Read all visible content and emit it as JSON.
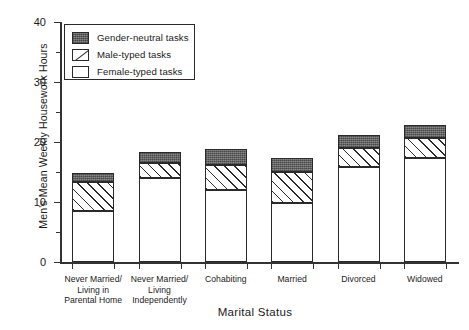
{
  "chart_data": {
    "type": "bar",
    "subtype": "stacked-bar",
    "title": "",
    "xlabel": "Marital Status",
    "ylabel": "Men's Mean Weekly Housework Hours",
    "ylim": [
      0,
      40
    ],
    "ytick_labels": [
      "0",
      "10",
      "20",
      "30",
      "40"
    ],
    "ytick_values": [
      0,
      10,
      20,
      30,
      40
    ],
    "yminor_values": [
      5,
      15,
      25,
      35
    ],
    "grid": false,
    "legend_position": "upper-left-inside",
    "categories": [
      "Never Married/\nLiving in\nParental Home",
      "Never Married/\nLiving\nIndependently",
      "Cohabiting",
      "Married",
      "Divorced",
      "Widowed"
    ],
    "category_lines": [
      [
        "Never Married/",
        "Living in",
        "Parental Home"
      ],
      [
        "Never Married/",
        "Living",
        "Independently"
      ],
      [
        "Cohabiting"
      ],
      [
        "Married"
      ],
      [
        "Divorced"
      ],
      [
        "Widowed"
      ]
    ],
    "series": [
      {
        "name": "Female-typed tasks",
        "fill": "white",
        "values": [
          8.5,
          14.0,
          12.0,
          9.8,
          15.8,
          17.3
        ]
      },
      {
        "name": "Male-typed tasks",
        "fill": "diagonal-hatch",
        "values": [
          4.8,
          2.5,
          4.2,
          5.2,
          3.2,
          3.3
        ]
      },
      {
        "name": "Gender-neutral tasks",
        "fill": "dark-gray",
        "values": [
          1.5,
          1.8,
          2.7,
          2.3,
          2.2,
          2.3
        ]
      }
    ],
    "totals": [
      14.8,
      18.3,
      18.9,
      17.3,
      21.2,
      22.9
    ]
  },
  "legend": {
    "items": [
      {
        "label": "Gender-neutral tasks",
        "swatch": "dark-gray-swatch"
      },
      {
        "label": "Male-typed tasks",
        "swatch": "hatched-swatch"
      },
      {
        "label": "Female-typed tasks",
        "swatch": "white-swatch"
      }
    ]
  },
  "colors": {
    "neutral_fill": "#6e6e6e",
    "hatch_line": "#2a2a2a",
    "female_fill": "#ffffff",
    "axis": "#333333",
    "text": "#1a1a1a",
    "background": "#ffffff"
  }
}
